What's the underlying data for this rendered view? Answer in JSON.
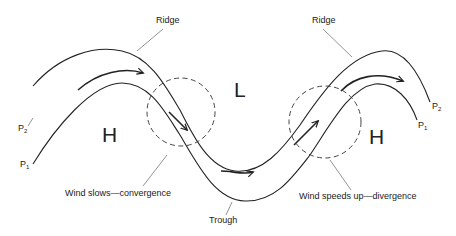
{
  "diagram": {
    "pressure_lines": [
      {
        "id": "P2",
        "label": "P",
        "subscript": "2"
      },
      {
        "id": "P1",
        "label": "P",
        "subscript": "1"
      }
    ],
    "pressure_centers": {
      "left_high": "H",
      "center_low": "L",
      "right_high": "H"
    },
    "labels": {
      "ridge_left": "Ridge",
      "ridge_right": "Ridge",
      "trough": "Trough",
      "convergence": "Wind slows—convergence",
      "divergence": "Wind speeds up—divergence"
    },
    "colors": {
      "line": "#222222",
      "leader": "#666666",
      "dashed": "#444444",
      "background": "#ffffff"
    }
  }
}
